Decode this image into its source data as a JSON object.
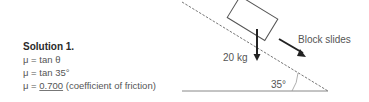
{
  "solution": {
    "title": "Solution 1.",
    "line1": "μ = tan θ",
    "line2": "μ = tan 35°",
    "line3_prefix": "μ = ",
    "line3_value": "0.700",
    "line3_suffix": " (coefficient of friction)"
  },
  "diagram": {
    "mass_label": "20 kg",
    "motion_label": "Block slides",
    "angle_label": "35°"
  }
}
